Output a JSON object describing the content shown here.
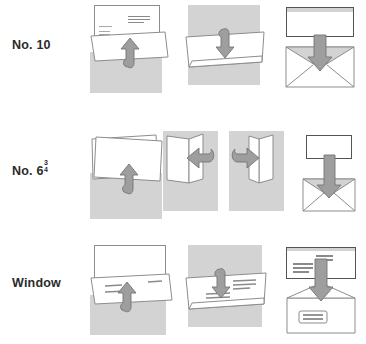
{
  "figure": {
    "background_color": "#ffffff",
    "panel_gray": "#d3d3d3",
    "paper_white": "#ffffff",
    "outline_gray": "#8d8d8d",
    "arrow_fill": "#9e9e9e",
    "arrow_stroke": "#707070",
    "text_color": "#2b2b2b"
  },
  "rows": [
    {
      "id": "no-10",
      "label": "No. 10",
      "label_prefix": "No. 10",
      "steps": [
        {
          "name": "fold-up",
          "arrow": "up",
          "description": "Fold bottom third of letter up"
        },
        {
          "name": "fold-down",
          "arrow": "down",
          "description": "Fold top third down"
        },
        {
          "name": "insert",
          "arrow": "down",
          "description": "Insert folded letter into No. 10 envelope"
        }
      ]
    },
    {
      "id": "no-6-3-4",
      "label": "No. 6 3/4",
      "label_prefix": "No. 6",
      "fraction_numerator": "3",
      "fraction_denominator": "4",
      "steps": [
        {
          "name": "fold-up",
          "arrow": "up",
          "description": "Fold letter in half upward"
        },
        {
          "name": "fold-left",
          "arrow": "left",
          "description": "Fold left panel over"
        },
        {
          "name": "fold-right",
          "arrow": "right",
          "description": "Fold right panel over"
        },
        {
          "name": "insert",
          "arrow": "down",
          "description": "Insert folded letter into No. 6 3/4 envelope"
        }
      ]
    },
    {
      "id": "window",
      "label": "Window",
      "label_prefix": "Window",
      "steps": [
        {
          "name": "fold-up",
          "arrow": "up",
          "description": "Fold bottom third up leaving address exposed"
        },
        {
          "name": "fold-down",
          "arrow": "down",
          "description": "Fold top third down behind"
        },
        {
          "name": "insert",
          "arrow": "down",
          "description": "Insert so the address shows through the window"
        }
      ]
    }
  ]
}
